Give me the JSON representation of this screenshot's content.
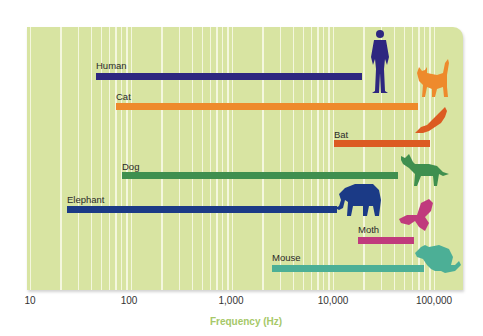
{
  "chart_data": {
    "type": "bar",
    "orientation": "horizontal-range",
    "title": "",
    "xlabel": "Frequency (Hz)",
    "ylabel": "",
    "xscale": "log",
    "xlim": [
      10,
      100000
    ],
    "x_ticks": [
      "10",
      "100",
      "1,000",
      "10,000",
      "100,000"
    ],
    "grid": true,
    "legend": null,
    "categories": [
      "Human",
      "Cat",
      "Bat",
      "Dog",
      "Elephant",
      "Moth",
      "Mouse"
    ],
    "series": [
      {
        "name": "Hearing range low (Hz)",
        "values": [
          45,
          70,
          10000,
          80,
          23,
          18000,
          2500
        ]
      },
      {
        "name": "Hearing range high (Hz)",
        "values": [
          20000,
          70000,
          90000,
          45000,
          11000,
          65000,
          80000
        ]
      }
    ],
    "ranges": [
      {
        "animal": "Human",
        "low": 45,
        "high": 20000,
        "color": "#2e2780"
      },
      {
        "animal": "Cat",
        "low": 70,
        "high": 70000,
        "color": "#ee8a2c"
      },
      {
        "animal": "Bat",
        "low": 10000,
        "high": 90000,
        "color": "#dc5b22"
      },
      {
        "animal": "Dog",
        "low": 80,
        "high": 45000,
        "color": "#3f8f4f"
      },
      {
        "animal": "Elephant",
        "low": 23,
        "high": 11000,
        "color": "#1b3a86"
      },
      {
        "animal": "Moth",
        "low": 18000,
        "high": 65000,
        "color": "#c03a7d"
      },
      {
        "animal": "Mouse",
        "low": 2500,
        "high": 80000,
        "color": "#4caf96"
      }
    ]
  },
  "labels": {
    "human": "Human",
    "cat": "Cat",
    "bat": "Bat",
    "dog": "Dog",
    "elephant": "Elephant",
    "moth": "Moth",
    "mouse": "Mouse"
  },
  "axis": {
    "ticks": [
      "10",
      "100",
      "1,000",
      "10,000",
      "100,000"
    ],
    "title": "Frequency (Hz)"
  },
  "colors": {
    "panel": "#d8e4a2",
    "grid": "#f6f8e2",
    "axis_title": "#a6c868"
  }
}
